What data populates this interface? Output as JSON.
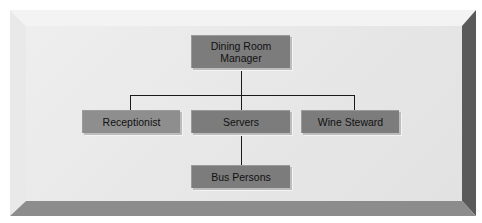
{
  "diagram": {
    "type": "org-chart",
    "nodes": [
      {
        "id": "manager",
        "label_line1": "Dining Room",
        "label_line2": "Manager",
        "level": 0
      },
      {
        "id": "receptionist",
        "label": "Receptionist",
        "level": 1,
        "parent": "manager"
      },
      {
        "id": "servers",
        "label": "Servers",
        "level": 1,
        "parent": "manager"
      },
      {
        "id": "wine-steward",
        "label": "Wine Steward",
        "level": 1,
        "parent": "manager"
      },
      {
        "id": "bus-persons",
        "label": "Bus Persons",
        "level": 2,
        "parent": "servers"
      }
    ],
    "colors": {
      "box_fill": "#7c7c7c",
      "box_fill_light": "#8e8e8e",
      "connector": "#1a1a1a",
      "panel_face": "#e8e8e8",
      "bevel_top": "#f3f3f3",
      "bevel_left": "#ececec",
      "bevel_right": "#555555",
      "bevel_bottom": "#8a8a8a"
    }
  }
}
